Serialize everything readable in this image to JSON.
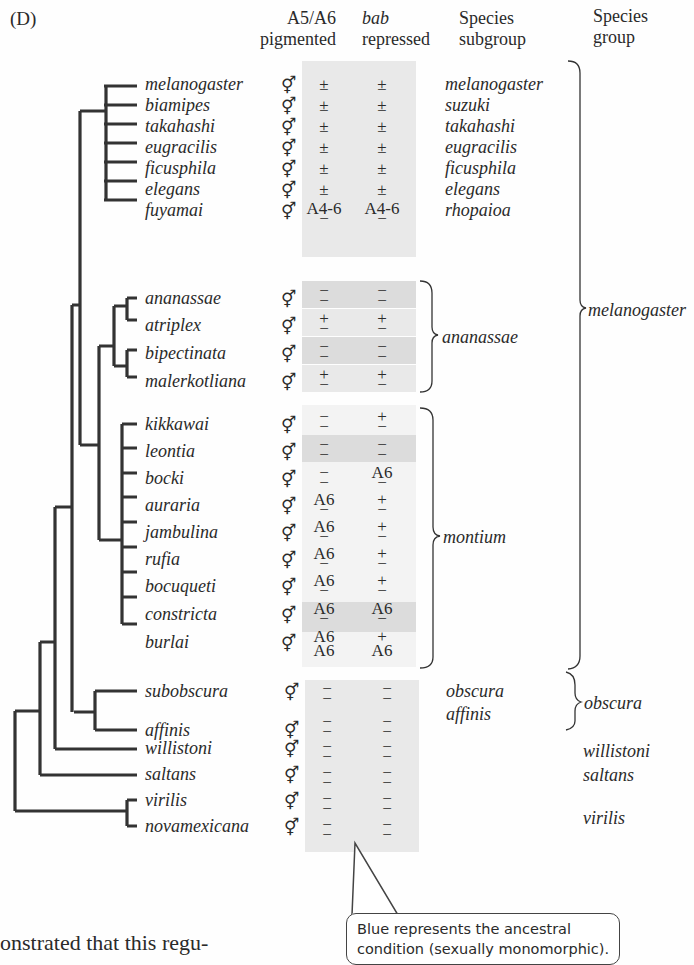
{
  "figure": {
    "panel_label": "(D)",
    "headers": {
      "a5a6": {
        "line1": "A5/A6",
        "line2": "pigmented"
      },
      "bab": {
        "line1": "bab",
        "line2": "repressed"
      },
      "subgroup": {
        "line1": "Species",
        "line2": "subgroup"
      },
      "group": {
        "line1": "Species",
        "line2": "group"
      }
    },
    "sex_symbol": "⚥",
    "species": [
      {
        "name": "melanogaster",
        "a5a6": "±",
        "bab": "±",
        "subgroup": "melanogaster"
      },
      {
        "name": "biamipes",
        "a5a6": "±",
        "bab": "±",
        "subgroup": "suzuki"
      },
      {
        "name": "takahashi",
        "a5a6": "±",
        "bab": "±",
        "subgroup": "takahashi"
      },
      {
        "name": "eugracilis",
        "a5a6": "±",
        "bab": "±",
        "subgroup": "eugracilis"
      },
      {
        "name": "ficusphila",
        "a5a6": "±",
        "bab": "±",
        "subgroup": "ficusphila"
      },
      {
        "name": "elegans",
        "a5a6": "±",
        "bab": "±",
        "subgroup": "elegans"
      },
      {
        "name": "fuyamai",
        "a5a6": "A4-6 / −",
        "bab": "A4-6 / −",
        "subgroup": "rhopaioa"
      },
      {
        "name": "ananassae",
        "a5a6": "− / −",
        "bab": "− / −",
        "subgroup": ""
      },
      {
        "name": "atriplex",
        "a5a6": "+ / −",
        "bab": "+ / −",
        "subgroup": ""
      },
      {
        "name": "bipectinata",
        "a5a6": "− / −",
        "bab": "− / −",
        "subgroup": ""
      },
      {
        "name": "malerkotliana",
        "a5a6": "+ / −",
        "bab": "+ / −",
        "subgroup": ""
      },
      {
        "name": "kikkawai",
        "a5a6": "− / −",
        "bab": "+ / −",
        "subgroup": ""
      },
      {
        "name": "leontia",
        "a5a6": "− / −",
        "bab": "− / −",
        "subgroup": ""
      },
      {
        "name": "bocki",
        "a5a6": "− / −",
        "bab": "A6 / −",
        "subgroup": ""
      },
      {
        "name": "auraria",
        "a5a6": "A6 / −",
        "bab": "+ / −",
        "subgroup": ""
      },
      {
        "name": "jambulina",
        "a5a6": "A6 / −",
        "bab": "+ / −",
        "subgroup": ""
      },
      {
        "name": "rufia",
        "a5a6": "A6 / −",
        "bab": "+ / −",
        "subgroup": ""
      },
      {
        "name": "bocuqueti",
        "a5a6": "A6 / −",
        "bab": "+ / −",
        "subgroup": ""
      },
      {
        "name": "constricta",
        "a5a6": "A6 / −",
        "bab": "A6 / −",
        "subgroup": ""
      },
      {
        "name": "burlai",
        "a5a6": "A6 / A6",
        "bab": "+ / A6",
        "subgroup": ""
      },
      {
        "name": "subobscura",
        "a5a6": "− / −",
        "bab": "− / −",
        "subgroup": "obscura"
      },
      {
        "name": "affinis",
        "a5a6": "− / −",
        "bab": "− / −",
        "subgroup": "affinis"
      },
      {
        "name": "willistoni",
        "a5a6": "− / −",
        "bab": "− / −",
        "subgroup": ""
      },
      {
        "name": "saltans",
        "a5a6": "− / −",
        "bab": "− / −",
        "subgroup": ""
      },
      {
        "name": "virilis",
        "a5a6": "− / −",
        "bab": "− / −",
        "subgroup": ""
      },
      {
        "name": "novamexicana",
        "a5a6": "− / −",
        "bab": "− / −",
        "subgroup": ""
      }
    ],
    "subgroup_brackets": [
      {
        "label": "ananassae"
      },
      {
        "label": "montium"
      }
    ],
    "groups": [
      {
        "label": "melanogaster"
      },
      {
        "label": "obscura"
      },
      {
        "label": "willistoni"
      },
      {
        "label": "saltans"
      },
      {
        "label": "virilis"
      }
    ],
    "callout": {
      "line1": "Blue represents the ancestral",
      "line2": "condition (sexually monomorphic)."
    },
    "body_text": "onstrated that this regu-"
  },
  "cells": {
    "pm": "±",
    "plus": "+",
    "minus": "−",
    "a46": "A4-6",
    "a6": "A6"
  }
}
